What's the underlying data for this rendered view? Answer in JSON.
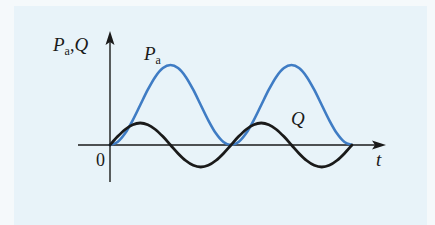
{
  "figure": {
    "y_axis_label": {
      "symbol1": "P",
      "sub1": "a",
      "sep": ",",
      "symbol2": "Q"
    },
    "x_axis_label": "t",
    "origin_label": "0",
    "curve_labels": {
      "pa": {
        "symbol": "P",
        "sub": "a"
      },
      "q": {
        "symbol": "Q"
      }
    },
    "colors": {
      "pa": "#3f7cc4",
      "q": "#1a1a1a",
      "axis": "#1a1a1a",
      "panel": "#e8f3f9"
    }
  },
  "chart_data": {
    "type": "line",
    "title": "",
    "xlabel": "t",
    "ylabel": "Pa, Q",
    "grid": false,
    "legend": "inline labels (Pa near first peak, Q near second positive lobe)",
    "xlim": [
      0,
      2
    ],
    "ylim": [
      -0.275,
      1
    ],
    "x": [
      0,
      0.0625,
      0.125,
      0.1875,
      0.25,
      0.3125,
      0.375,
      0.4375,
      0.5,
      0.5625,
      0.625,
      0.6875,
      0.75,
      0.8125,
      0.875,
      0.9375,
      1,
      1.0625,
      1.125,
      1.1875,
      1.25,
      1.3125,
      1.375,
      1.4375,
      1.5,
      1.5625,
      1.625,
      1.6875,
      1.75,
      1.8125,
      1.875,
      1.9375,
      2
    ],
    "series": [
      {
        "name": "Pa",
        "values": [
          0,
          0.038,
          0.146,
          0.309,
          0.5,
          0.691,
          0.854,
          0.962,
          1,
          0.962,
          0.854,
          0.691,
          0.5,
          0.309,
          0.146,
          0.038,
          0,
          0.038,
          0.146,
          0.309,
          0.5,
          0.691,
          0.854,
          0.962,
          1,
          0.962,
          0.854,
          0.691,
          0.5,
          0.309,
          0.146,
          0.038,
          0
        ]
      },
      {
        "name": "Q",
        "values": [
          0,
          0.105,
          0.194,
          0.254,
          0.275,
          0.254,
          0.194,
          0.105,
          0,
          -0.105,
          -0.194,
          -0.254,
          -0.275,
          -0.254,
          -0.194,
          -0.105,
          0,
          0.105,
          0.194,
          0.254,
          0.275,
          0.254,
          0.194,
          0.105,
          0,
          -0.105,
          -0.194,
          -0.254,
          -0.275,
          -0.254,
          -0.194,
          -0.105,
          0
        ]
      }
    ]
  }
}
